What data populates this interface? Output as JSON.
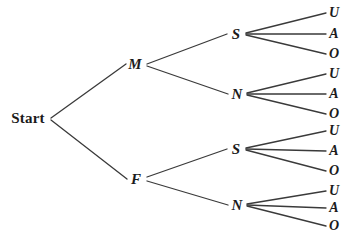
{
  "diagram": {
    "type": "tree",
    "background_color": "#ffffff",
    "line_color": "#3a3a3a",
    "text_color": "#1b1b1b",
    "root": {
      "id": "start",
      "label": "Start",
      "x": 28,
      "y": 118
    },
    "levels": [
      {
        "name": "gender",
        "options": [
          "M",
          "F"
        ]
      },
      {
        "name": "smoking",
        "options": [
          "S",
          "N"
        ]
      },
      {
        "name": "blood-type",
        "options": [
          "U",
          "A",
          "O"
        ]
      }
    ],
    "nodes": [
      {
        "id": "m",
        "label": "M",
        "level": 1,
        "x": 135,
        "y": 64
      },
      {
        "id": "f",
        "label": "F",
        "level": 1,
        "x": 136,
        "y": 179
      },
      {
        "id": "m-s",
        "label": "S",
        "level": 2,
        "x": 236,
        "y": 34
      },
      {
        "id": "m-n",
        "label": "N",
        "level": 2,
        "x": 237,
        "y": 94
      },
      {
        "id": "f-s",
        "label": "S",
        "level": 2,
        "x": 236,
        "y": 149
      },
      {
        "id": "f-n",
        "label": "N",
        "level": 2,
        "x": 237,
        "y": 205
      },
      {
        "id": "m-s-u",
        "label": "U",
        "level": 3,
        "x": 334,
        "y": 13
      },
      {
        "id": "m-s-a",
        "label": "A",
        "level": 3,
        "x": 334,
        "y": 34
      },
      {
        "id": "m-s-o",
        "label": "O",
        "level": 3,
        "x": 334,
        "y": 54
      },
      {
        "id": "m-n-u",
        "label": "U",
        "level": 3,
        "x": 334,
        "y": 74
      },
      {
        "id": "m-n-a",
        "label": "A",
        "level": 3,
        "x": 334,
        "y": 94
      },
      {
        "id": "m-n-o",
        "label": "O",
        "level": 3,
        "x": 334,
        "y": 114
      },
      {
        "id": "f-s-u",
        "label": "U",
        "level": 3,
        "x": 334,
        "y": 131
      },
      {
        "id": "f-s-a",
        "label": "A",
        "level": 3,
        "x": 334,
        "y": 151
      },
      {
        "id": "f-s-o",
        "label": "O",
        "level": 3,
        "x": 334,
        "y": 171
      },
      {
        "id": "f-n-u",
        "label": "U",
        "level": 3,
        "x": 334,
        "y": 191
      },
      {
        "id": "f-n-a",
        "label": "A",
        "level": 3,
        "x": 334,
        "y": 208
      },
      {
        "id": "f-n-o",
        "label": "O",
        "level": 3,
        "x": 334,
        "y": 226
      }
    ],
    "edges": [
      {
        "id": "start-m",
        "from": "start",
        "to": "m",
        "x1": 51,
        "y1": 118,
        "x2": 126,
        "y2": 64
      },
      {
        "id": "start-f",
        "from": "start",
        "to": "f",
        "x1": 51,
        "y1": 120,
        "x2": 127,
        "y2": 179
      },
      {
        "id": "m-to-s",
        "from": "m",
        "to": "m-s",
        "x1": 147,
        "y1": 64,
        "x2": 227,
        "y2": 34
      },
      {
        "id": "m-to-n",
        "from": "m",
        "to": "m-n",
        "x1": 147,
        "y1": 66,
        "x2": 228,
        "y2": 94
      },
      {
        "id": "f-to-s",
        "from": "f",
        "to": "f-s",
        "x1": 147,
        "y1": 177,
        "x2": 227,
        "y2": 149
      },
      {
        "id": "f-to-n",
        "from": "f",
        "to": "f-n",
        "x1": 147,
        "y1": 181,
        "x2": 228,
        "y2": 205
      },
      {
        "id": "ms-to-u",
        "from": "m-s",
        "to": "m-s-u",
        "x1": 246,
        "y1": 33,
        "x2": 326,
        "y2": 13
      },
      {
        "id": "ms-to-a",
        "from": "m-s",
        "to": "m-s-a",
        "x1": 246,
        "y1": 34,
        "x2": 326,
        "y2": 34
      },
      {
        "id": "ms-to-o",
        "from": "m-s",
        "to": "m-s-o",
        "x1": 246,
        "y1": 35,
        "x2": 326,
        "y2": 54
      },
      {
        "id": "mn-to-u",
        "from": "m-n",
        "to": "m-n-u",
        "x1": 247,
        "y1": 93,
        "x2": 326,
        "y2": 74
      },
      {
        "id": "mn-to-a",
        "from": "m-n",
        "to": "m-n-a",
        "x1": 247,
        "y1": 94,
        "x2": 326,
        "y2": 94
      },
      {
        "id": "mn-to-o",
        "from": "m-n",
        "to": "m-n-o",
        "x1": 247,
        "y1": 95,
        "x2": 326,
        "y2": 114
      },
      {
        "id": "fs-to-u",
        "from": "f-s",
        "to": "f-s-u",
        "x1": 246,
        "y1": 148,
        "x2": 326,
        "y2": 131
      },
      {
        "id": "fs-to-a",
        "from": "f-s",
        "to": "f-s-a",
        "x1": 246,
        "y1": 149,
        "x2": 326,
        "y2": 151
      },
      {
        "id": "fs-to-o",
        "from": "f-s",
        "to": "f-s-o",
        "x1": 246,
        "y1": 150,
        "x2": 326,
        "y2": 171
      },
      {
        "id": "fn-to-u",
        "from": "f-n",
        "to": "f-n-u",
        "x1": 247,
        "y1": 204,
        "x2": 326,
        "y2": 191
      },
      {
        "id": "fn-to-a",
        "from": "f-n",
        "to": "f-n-a",
        "x1": 247,
        "y1": 205,
        "x2": 326,
        "y2": 208
      },
      {
        "id": "fn-to-o",
        "from": "f-n",
        "to": "f-n-o",
        "x1": 247,
        "y1": 206,
        "x2": 326,
        "y2": 226
      }
    ]
  }
}
